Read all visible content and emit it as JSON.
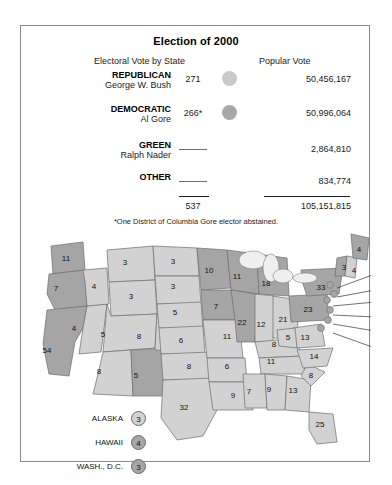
{
  "header": {
    "title": "Election of 2000",
    "col_electoral": "Electoral Vote by State",
    "col_popular": "Popular Vote",
    "footnote": "*One District of Columbia Gore elector abstained.",
    "total_electoral": "537",
    "total_popular": "105,151,815"
  },
  "rows": [
    {
      "party": "REPUBLICAN",
      "candidate": "George W. Bush",
      "electoral": "271",
      "popular": "50,456,167",
      "swatch": "#c9c9c9",
      "has_swatch": true
    },
    {
      "party": "DEMOCRATIC",
      "candidate": "Al Gore",
      "electoral": "266*",
      "popular": "50,996,064",
      "swatch": "#a8a8a8",
      "has_swatch": true
    },
    {
      "party": "GREEN",
      "candidate": "Ralph Nader",
      "electoral": "",
      "popular": "2,864,810",
      "swatch": "",
      "has_swatch": false
    },
    {
      "party": "OTHER",
      "candidate": "",
      "electoral": "",
      "popular": "834,774",
      "swatch": "",
      "has_swatch": false
    }
  ],
  "colors": {
    "bush_fill": "#d2d2d2",
    "gore_fill": "#a5a5a5",
    "water_fill": "#efefef",
    "stroke": "#6d6d6d"
  },
  "map": {
    "states": [
      {
        "code": "WA",
        "label": "11",
        "x": 45,
        "y": 35,
        "winner": "gore"
      },
      {
        "code": "OR",
        "label": "7",
        "x": 35,
        "y": 65,
        "winner": "gore"
      },
      {
        "code": "CA",
        "label": "54",
        "x": 26,
        "y": 127,
        "winner": "gore"
      },
      {
        "code": "NV",
        "label": "4",
        "x": 53,
        "y": 105,
        "winner": "bush"
      },
      {
        "code": "ID",
        "label": "4",
        "x": 73,
        "y": 63,
        "winner": "bush"
      },
      {
        "code": "MT",
        "label": "3",
        "x": 104,
        "y": 39,
        "winner": "bush"
      },
      {
        "code": "WY",
        "label": "3",
        "x": 110,
        "y": 73,
        "winner": "bush"
      },
      {
        "code": "UT",
        "label": "5",
        "x": 82,
        "y": 111,
        "winner": "bush"
      },
      {
        "code": "AZ",
        "label": "8",
        "x": 78,
        "y": 148,
        "winner": "bush"
      },
      {
        "code": "NM",
        "label": "5",
        "x": 115,
        "y": 152,
        "winner": "gore"
      },
      {
        "code": "CO",
        "label": "8",
        "x": 118,
        "y": 113,
        "winner": "bush"
      },
      {
        "code": "ND",
        "label": "3",
        "x": 152,
        "y": 38,
        "winner": "bush"
      },
      {
        "code": "SD",
        "label": "3",
        "x": 152,
        "y": 63,
        "winner": "bush"
      },
      {
        "code": "NE",
        "label": "5",
        "x": 154,
        "y": 89,
        "winner": "bush"
      },
      {
        "code": "KS",
        "label": "6",
        "x": 160,
        "y": 117,
        "winner": "bush"
      },
      {
        "code": "OK",
        "label": "8",
        "x": 168,
        "y": 143,
        "winner": "bush"
      },
      {
        "code": "TX",
        "label": "32",
        "x": 163,
        "y": 184,
        "winner": "bush"
      },
      {
        "code": "MN",
        "label": "10",
        "x": 188,
        "y": 47,
        "winner": "gore"
      },
      {
        "code": "IA",
        "label": "7",
        "x": 195,
        "y": 83,
        "winner": "gore"
      },
      {
        "code": "MO",
        "label": "11",
        "x": 206,
        "y": 113,
        "winner": "bush"
      },
      {
        "code": "AR",
        "label": "6",
        "x": 206,
        "y": 143,
        "winner": "bush"
      },
      {
        "code": "LA",
        "label": "9",
        "x": 212,
        "y": 172,
        "winner": "bush"
      },
      {
        "code": "WI",
        "label": "11",
        "x": 216,
        "y": 53,
        "winner": "gore"
      },
      {
        "code": "IL",
        "label": "22",
        "x": 221,
        "y": 99,
        "winner": "gore"
      },
      {
        "code": "MI",
        "label": "18",
        "x": 245,
        "y": 60,
        "winner": "gore"
      },
      {
        "code": "IN",
        "label": "12",
        "x": 240,
        "y": 101,
        "winner": "bush"
      },
      {
        "code": "OH",
        "label": "21",
        "x": 262,
        "y": 96,
        "winner": "bush"
      },
      {
        "code": "KY",
        "label": "8",
        "x": 253,
        "y": 121,
        "winner": "bush"
      },
      {
        "code": "TN",
        "label": "11",
        "x": 250,
        "y": 138,
        "winner": "bush"
      },
      {
        "code": "MS",
        "label": "7",
        "x": 228,
        "y": 168,
        "winner": "bush"
      },
      {
        "code": "AL",
        "label": "9",
        "x": 248,
        "y": 166,
        "winner": "bush"
      },
      {
        "code": "GA",
        "label": "13",
        "x": 272,
        "y": 167,
        "winner": "bush"
      },
      {
        "code": "FL",
        "label": "25",
        "x": 299,
        "y": 201,
        "winner": "bush"
      },
      {
        "code": "SC",
        "label": "8",
        "x": 290,
        "y": 152,
        "winner": "bush"
      },
      {
        "code": "NC",
        "label": "14",
        "x": 293,
        "y": 133,
        "winner": "bush"
      },
      {
        "code": "VA",
        "label": "13",
        "x": 284,
        "y": 114,
        "winner": "bush"
      },
      {
        "code": "WV",
        "label": "5",
        "x": 267,
        "y": 114,
        "winner": "bush"
      },
      {
        "code": "PA",
        "label": "23",
        "x": 287,
        "y": 86,
        "winner": "gore"
      },
      {
        "code": "NY",
        "label": "33",
        "x": 300,
        "y": 64,
        "winner": "gore"
      },
      {
        "code": "VT",
        "label": "3",
        "x": 323,
        "y": 44,
        "winner": "gore"
      },
      {
        "code": "NH",
        "label": "4",
        "x": 333,
        "y": 47,
        "winner": "bush"
      },
      {
        "code": "ME",
        "label": "4",
        "x": 338,
        "y": 26,
        "winner": "gore"
      }
    ],
    "callouts": [
      {
        "code": "MA",
        "label": "12",
        "x": 357,
        "y": 50
      },
      {
        "code": "RI",
        "label": "4",
        "x": 357,
        "y": 66
      },
      {
        "code": "CT",
        "label": "8",
        "x": 357,
        "y": 78
      },
      {
        "code": "NJ",
        "label": "15",
        "x": 357,
        "y": 93
      },
      {
        "code": "DE",
        "label": "3",
        "x": 357,
        "y": 107
      },
      {
        "code": "MD",
        "label": "10",
        "x": 357,
        "y": 124
      }
    ]
  },
  "legend": [
    {
      "name": "ALASKA",
      "label": "3",
      "winner": "bush"
    },
    {
      "name": "HAWAII",
      "label": "4",
      "winner": "gore"
    },
    {
      "name": "WASH., D.C.",
      "label": "3",
      "winner": "gore"
    }
  ]
}
